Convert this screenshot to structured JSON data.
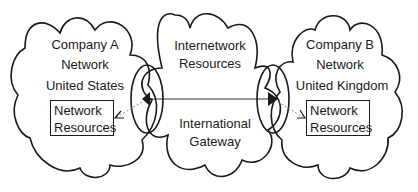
{
  "diagram": {
    "type": "network-cloud-diagram",
    "clouds": [
      {
        "id": "company-a",
        "lines": [
          "Company A",
          "Network",
          "United States"
        ],
        "box": [
          "Network",
          "Resources"
        ]
      },
      {
        "id": "internetwork",
        "lines": [
          "Internetwork",
          "Resources"
        ],
        "lower_lines": [
          "International",
          "Gateway"
        ]
      },
      {
        "id": "company-b",
        "lines": [
          "Company B",
          "Network",
          "United Kingdom"
        ],
        "box": [
          "Network",
          "Resources"
        ]
      }
    ],
    "connections": [
      {
        "from": "company-a-gateway",
        "to": "company-b-gateway",
        "style": "solid"
      },
      {
        "from": "company-a-gateway",
        "to": "company-a-resources",
        "style": "dotted-arrow"
      },
      {
        "from": "company-b-gateway",
        "to": "company-b-resources",
        "style": "dotted-arrow"
      }
    ],
    "colors": {
      "stroke": "#1a1a1a",
      "dotted": "#8a8a8a",
      "background": "#ffffff"
    }
  }
}
